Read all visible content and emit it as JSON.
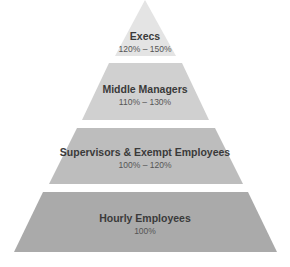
{
  "diagram": {
    "type": "pyramid",
    "tiers": [
      {
        "title": "Execs",
        "range": "120% – 150%",
        "color": "#e4e4e4"
      },
      {
        "title": "Middle Managers",
        "range": "110% – 130%",
        "color": "#d0d0d0"
      },
      {
        "title": "Supervisors & Exempt Employees",
        "range": "100% – 120%",
        "color": "#bdbdbd"
      },
      {
        "title": "Hourly Employees",
        "range": "100%",
        "color": "#aaaaaa"
      }
    ]
  }
}
